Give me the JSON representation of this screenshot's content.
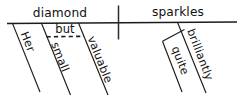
{
  "diagram": {
    "type": "reed-kellogg-sentence-diagram",
    "sentence": "Her small but valuable diamond sparkles quite brilliantly.",
    "baseline": {
      "subject": "diamond",
      "predicate": "sparkles",
      "divider": "subject-predicate-divider"
    },
    "words": {
      "subject": "diamond",
      "verb": "sparkles",
      "modifier_her": "Her",
      "modifier_small": "small",
      "conjunction_but": "but",
      "modifier_valuable": "valuable",
      "modifier_quite": "quite",
      "modifier_brilliantly": "brilliantly"
    },
    "colors": {
      "ink": "#1b1b1b",
      "text": "#111111",
      "background": "#ffffff"
    },
    "structure": {
      "subject_modifiers": [
        "Her",
        "small",
        "valuable"
      ],
      "verb_modifiers": [
        "brilliantly"
      ],
      "adverb_modifiers": [
        "quite"
      ],
      "coordinating_conjunction": "but",
      "conjunction_joins": [
        "small",
        "valuable"
      ]
    }
  }
}
